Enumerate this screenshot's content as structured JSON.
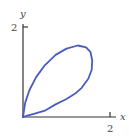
{
  "chart_data": {
    "type": "line",
    "title": "",
    "xlabel": "x",
    "ylabel": "y",
    "xlim": [
      0,
      2.1
    ],
    "ylim": [
      0,
      2.1
    ],
    "x_ticks": [
      2
    ],
    "y_ticks": [
      2
    ],
    "x_tick_labels": [
      "2"
    ],
    "y_tick_labels": [
      "2"
    ],
    "grid": false,
    "legend": null,
    "series": [
      {
        "name": "closed loop curve (folium-like petal)",
        "color": "#4a5cc0",
        "closed": true,
        "x": [
          0,
          0.05,
          0.15,
          0.3,
          0.5,
          0.75,
          1.0,
          1.26,
          1.45,
          1.55,
          1.59,
          1.58,
          1.5,
          1.35,
          1.2,
          1.0,
          0.75,
          0.5,
          0.25,
          0.1,
          0
        ],
        "y": [
          0,
          0.32,
          0.6,
          0.88,
          1.15,
          1.38,
          1.52,
          1.59,
          1.55,
          1.45,
          1.26,
          1.05,
          0.85,
          0.65,
          0.52,
          0.4,
          0.28,
          0.14,
          0.07,
          0.03,
          0
        ]
      }
    ]
  },
  "axes": {
    "x_label": "x",
    "y_label": "y",
    "x_tick_label": "2",
    "y_tick_label": "2"
  }
}
